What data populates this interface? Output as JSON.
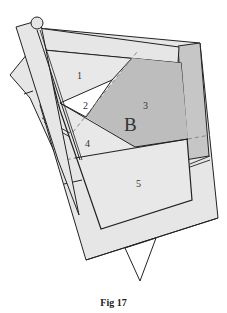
{
  "figure": {
    "caption": "Fig 17",
    "region_labels": {
      "r1": "1",
      "r2": "2",
      "r3": "3",
      "r4": "4",
      "r5": "5",
      "big_letter": "B"
    },
    "colors": {
      "paper_light": "#e6e6e6",
      "paper_mid": "#d4d4d4",
      "shaded_region": "#bdbdbd",
      "white_region": "#ffffff",
      "outline": "#222222",
      "dashed": "#888888",
      "label_text": "#444444"
    },
    "features": {
      "pin_head": "circle at top-left of diagonal strip",
      "bottom_point": "downward triangle below main square",
      "dashed_fold_lines": 3
    }
  }
}
